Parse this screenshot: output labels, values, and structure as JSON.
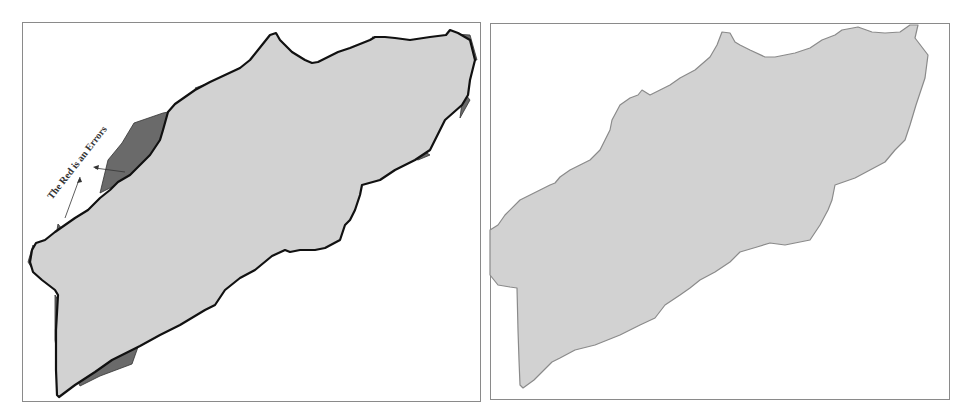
{
  "figure": {
    "panels": [
      {
        "id": "left",
        "description": "Watershed boundary overlay with error regions",
        "annotation": "The Red is an Errors",
        "colors": {
          "fill": "#d2d2d2",
          "error": "#6a6a6a",
          "outline": "#111111"
        }
      },
      {
        "id": "right",
        "description": "Watershed polygon",
        "colors": {
          "fill": "#d2d2d2",
          "outline": "#8a8a8a"
        }
      }
    ]
  }
}
